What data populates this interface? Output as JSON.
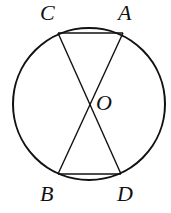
{
  "diagram": {
    "type": "circle-with-chords",
    "circle": {
      "cx": 89,
      "cy": 104,
      "r": 76
    },
    "points": {
      "C": {
        "x": 58,
        "y": 33
      },
      "A": {
        "x": 123,
        "y": 33
      },
      "B": {
        "x": 58,
        "y": 174
      },
      "D": {
        "x": 121,
        "y": 174
      },
      "O": {
        "x": 89,
        "y": 104
      }
    },
    "segments": [
      "CA",
      "BD",
      "AB",
      "CD"
    ],
    "labels": {
      "C": "C",
      "A": "A",
      "O": "O",
      "B": "B",
      "D": "D"
    },
    "stroke_color": "#111111"
  }
}
